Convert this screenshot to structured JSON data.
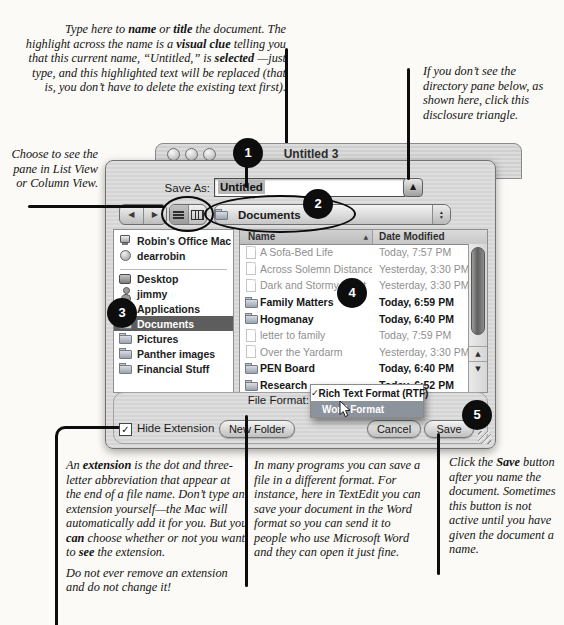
{
  "annotations": {
    "top_left": {
      "segments": [
        {
          "t": "Type here to "
        },
        {
          "t": "name",
          "b": 1
        },
        {
          "t": " or "
        },
        {
          "t": "title",
          "b": 1
        },
        {
          "t": " the document. The highlight across the name is a "
        },
        {
          "t": "visual clue",
          "b": 1
        },
        {
          "t": " telling you that this current name, “Untitled,” is "
        },
        {
          "t": "selected",
          "b": 1
        },
        {
          "t": " —just type, and this highlighted text will be replaced (that is, you don’t have to delete the existing text first)."
        }
      ]
    },
    "top_right": {
      "text": "If you don’t see the directory pane below, as shown here, click this disclosure triangle."
    },
    "left": {
      "text": "Choose to see the pane in List View or Column View."
    },
    "bottom_left": {
      "paras": [
        [
          {
            "t": "An "
          },
          {
            "t": "extension",
            "b": 1
          },
          {
            "t": " is the dot and three-letter abbreviation that appear at the end of a file name. Don’t type an extension yourself—the Mac will automatically add it for you. But you "
          },
          {
            "t": "can",
            "b": 1
          },
          {
            "t": " choose whether or not you want to "
          },
          {
            "t": "see",
            "b": 1
          },
          {
            "t": " the extension."
          }
        ],
        [
          {
            "t": "Do not ever remove an extension and do not change it!"
          }
        ]
      ]
    },
    "bottom_mid": {
      "text": "In many programs you can save a file in a different format. For instance, here in TextEdit you can save your document in the Word format so you can send it to people who use Microsoft Word and they can open it just fine."
    },
    "bottom_right": {
      "segments": [
        {
          "t": "Click the "
        },
        {
          "t": "Save",
          "b": 1
        },
        {
          "t": " button after you name the document. Sometimes this button is not active until you have given the document a name."
        }
      ]
    }
  },
  "window": {
    "title": "Untitled 3"
  },
  "dialog": {
    "save_as": {
      "label": "Save As:",
      "value": "Untitled"
    },
    "toolbar": {
      "location": "Documents"
    },
    "sidebar": {
      "items": [
        {
          "label": "Robin's Office Mac",
          "icon": "computer"
        },
        {
          "label": "dearrobin",
          "icon": "idisk"
        },
        {
          "divider": true
        },
        {
          "label": "Desktop",
          "icon": "desktop"
        },
        {
          "label": "jimmy",
          "icon": "home"
        },
        {
          "label": "Applications",
          "icon": "app"
        },
        {
          "label": "Documents",
          "icon": "folder",
          "selected": true
        },
        {
          "label": "Pictures",
          "icon": "folder"
        },
        {
          "label": "Panther images",
          "icon": "folder"
        },
        {
          "label": "Financial Stuff",
          "icon": "folder"
        }
      ]
    },
    "file_list": {
      "columns": {
        "name": "Name",
        "date": "Date Modified"
      },
      "rows": [
        {
          "name": "A Sofa-Bed Life",
          "date": "Today, 7:57 PM",
          "type": "doc",
          "dim": true
        },
        {
          "name": "Across Solemn Distances",
          "date": "Yesterday, 3:30 PM",
          "type": "doc",
          "dim": true
        },
        {
          "name": "Dark and Stormy Night",
          "date": "Yesterday, 3:30 PM",
          "type": "doc",
          "dim": true
        },
        {
          "name": "Family Matters",
          "date": "Today, 6:59 PM",
          "type": "folder"
        },
        {
          "name": "Hogmanay",
          "date": "Today, 6:40 PM",
          "type": "folder"
        },
        {
          "name": "letter to family",
          "date": "Today, 7:59 PM",
          "type": "doc",
          "dim": true
        },
        {
          "name": "Over the Yardarm",
          "date": "Yesterday, 3:30 PM",
          "type": "doc",
          "dim": true
        },
        {
          "name": "PEN Board",
          "date": "Today, 6:40 PM",
          "type": "folder"
        },
        {
          "name": "Research",
          "date": "Today, 6:52 PM",
          "type": "folder"
        }
      ]
    },
    "file_format": {
      "label": "File Format:",
      "menu": [
        {
          "label": "Rich Text Format (RTF)",
          "checked": true
        },
        {
          "label": "Word Format",
          "highlighted": true
        }
      ]
    },
    "footer": {
      "hide_extension": "Hide Extension",
      "new_folder": "New Folder",
      "cancel": "Cancel",
      "save": "Save"
    }
  },
  "callouts": {
    "c1": "1",
    "c2": "2",
    "c3": "3",
    "c4": "4",
    "c5": "5"
  },
  "icons": {
    "checkmark": "✓",
    "sort_asc": "▲",
    "back": "◀",
    "forward": "▶",
    "disclosure": "▲",
    "stepper_up": "▴",
    "stepper_down": "▾",
    "scroll_up": "▲",
    "scroll_down": "▼"
  },
  "colors": {
    "callout_bg": "#0d0d0d",
    "selection_highlight": "#b7b7b7",
    "sidebar_selected": "#5d5d5d",
    "menu_highlight": "#8d939c"
  }
}
